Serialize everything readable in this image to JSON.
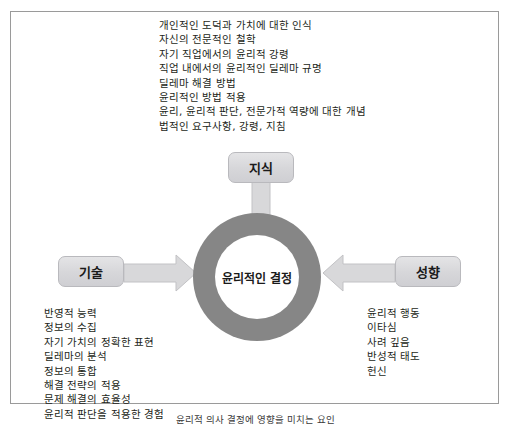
{
  "diagram": {
    "title_center": "윤리적인 결정",
    "nodes": {
      "top": "지식",
      "left": "기술",
      "right": "성향"
    },
    "top_list": [
      "개인적인 도덕과 가치에 대한 인식",
      "자신의 전문적인 철학",
      "자기 직업에서의 윤리적 강령",
      "직업 내에서의 윤리적인 딜레마 규명",
      "딜레마 해결 방법",
      "윤리적인 방법 적용",
      "윤리, 윤리적 판단, 전문가적 역량에 대한 개념",
      "법적인 요구사항, 강령, 지침"
    ],
    "left_list": [
      "반영적 능력",
      "정보의 수집",
      "자기 가치의 정확한 표현",
      "딜레마의 분석",
      "정보의 통합",
      "해결 전략의 적용",
      "문제 해결의 효율성",
      "윤리적 판단을 적용한 경험"
    ],
    "right_list": [
      "윤리적 행동",
      "이타심",
      "사려 깊음",
      "반성적 태도",
      "헌신"
    ],
    "caption": "윤리적 의사 결정에 영향을 미치는 요인",
    "colors": {
      "ring": "#868686",
      "box_fill": "#d6d6d9",
      "arrow_fill": "#d8d8da",
      "frame_border": "#9a9a9a",
      "text": "#231f20"
    }
  }
}
